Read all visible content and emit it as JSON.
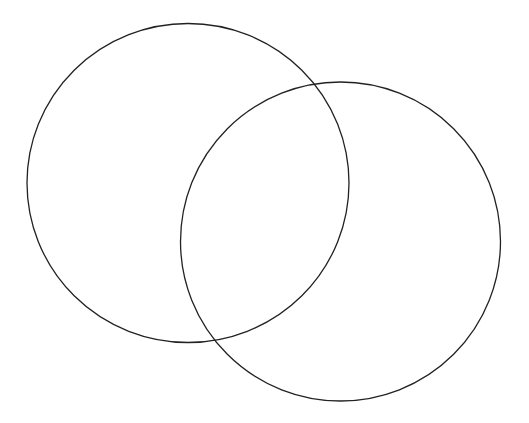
{
  "diagram": {
    "type": "venn",
    "background": "#ffffff",
    "stroke_color": "#222222",
    "stroke_width": 1.3,
    "sets": [
      {
        "name": "set-a",
        "label": "",
        "cx": 188,
        "cy": 183,
        "rx": 161,
        "ry": 159.5
      },
      {
        "name": "set-b",
        "label": "",
        "cx": 340.5,
        "cy": 241.5,
        "rx": 160,
        "ry": 159.5
      }
    ],
    "intersections": [
      {
        "x": 315,
        "y": 85
      },
      {
        "x": 215,
        "y": 340
      }
    ]
  }
}
